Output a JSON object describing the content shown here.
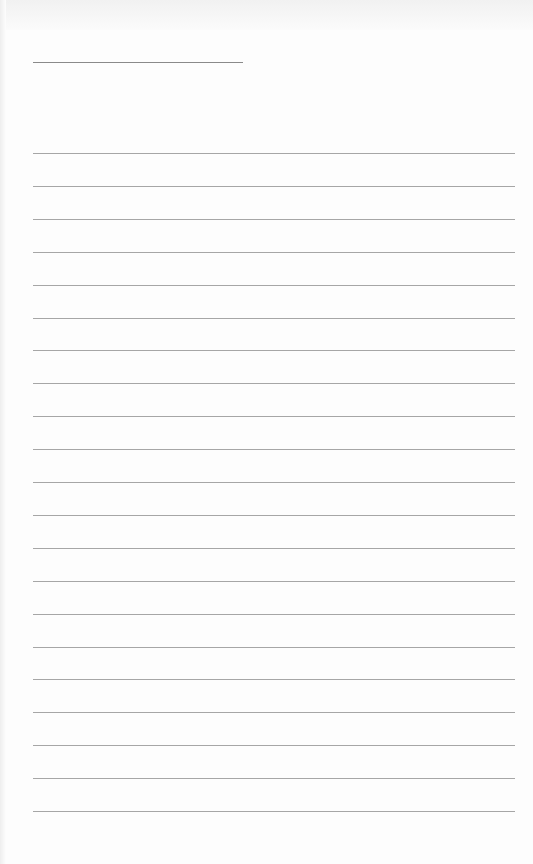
{
  "page": {
    "type": "blank lined sheet",
    "title_line": {
      "x": 33,
      "y": 62,
      "width": 210
    },
    "rules": {
      "count": 21,
      "start_y": 153,
      "spacing": 32.9,
      "x": 33,
      "width": 482,
      "color": "#a6a6a6"
    },
    "background_color": "#fdfdfd"
  }
}
